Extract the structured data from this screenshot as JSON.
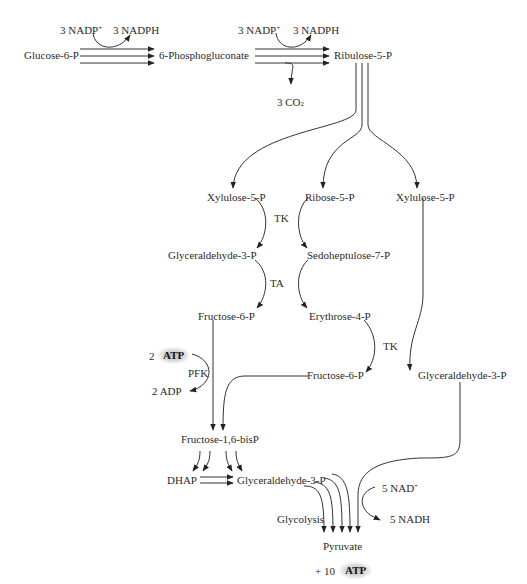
{
  "top_row": {
    "glucose6p": "Glucose-6-P",
    "phosphogluconate": "6-Phosphogluconate",
    "ribulose5p": "Ribulose-5-P",
    "step1_nadp": "3 NADP",
    "step1_nadp_charge": "+",
    "step1_nadph": "3 NADPH",
    "step2_nadp": "3 NADP",
    "step2_nadp_charge": "+",
    "step2_nadph": "3 NADPH",
    "co2": "3 CO",
    "co2_sub": "2"
  },
  "branch": {
    "xylulose5p_left": "Xylulose-5-P",
    "ribose5p": "Ribose-5-P",
    "xylulose5p_right": "Xylulose-5-P",
    "tk1": "TK",
    "glyceraldehyde3p_left": "Glyceraldehyde-3-P",
    "sedoheptulose7p": "Sedoheptulose-7-P",
    "ta": "TA",
    "fructose6p_left": "Fructose-6-P",
    "erythrose4p": "Erythrose-4-P",
    "tk2": "TK",
    "fructose6p_mid": "Fructose-6-P",
    "glyceraldehyde3p_right": "Glyceraldehyde-3-P"
  },
  "pfk_step": {
    "atp_count": "2",
    "atp": "ATP",
    "enzyme": "PFK",
    "adp": "2 ADP"
  },
  "glycolysis": {
    "fructose16bisp": "Fructose-1,6-bisP",
    "dhap": "DHAP",
    "glyceraldehyde3p": "Glyceraldehyde-3-P",
    "nad": "5 NAD",
    "nad_charge": "+",
    "nadh": "5 NADH",
    "label": "Glycolysis",
    "pyruvate": "Pyruvate",
    "atp_prefix": "+ 10",
    "atp": "ATP"
  }
}
